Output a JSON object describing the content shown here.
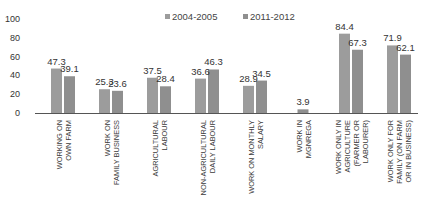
{
  "chart_data": {
    "type": "bar",
    "title": "",
    "xlabel": "",
    "ylabel": "",
    "ylim": [
      0,
      100
    ],
    "yticks": [
      0,
      20,
      40,
      60,
      80,
      100
    ],
    "grid": false,
    "legend_position": "top-center",
    "categories": [
      [
        "WORKING ON",
        "OWN FARM"
      ],
      [
        "WORK ON",
        "FAMILY BUSINESS"
      ],
      [
        "AGRICULTURAL",
        "LABOUR"
      ],
      [
        "NON-AGRICULTURAL",
        "DAILY LABOUR"
      ],
      [
        "WORK ON MONTHLY",
        "SALARY"
      ],
      [
        "WORK IN",
        "MGNREGA"
      ],
      [
        "WORK ONLY IN",
        "AGRICULTURE",
        "(FARMER OR",
        "LABOURER)"
      ],
      [
        "WORK ONLY FOR",
        "FAMILY (ON FARM",
        "OR IN BUSINESS)"
      ]
    ],
    "series": [
      {
        "name": "2004-2005",
        "color": "#9c9c9c",
        "values": [
          47.3,
          25.3,
          37.5,
          36.6,
          28.9,
          null,
          84.4,
          71.9
        ]
      },
      {
        "name": "2011-2012",
        "color": "#8f8f8f",
        "values": [
          39.1,
          23.6,
          28.4,
          46.3,
          34.5,
          3.9,
          67.3,
          62.1
        ]
      }
    ]
  },
  "colors": {
    "axis": "#555555",
    "text": "#333333"
  }
}
